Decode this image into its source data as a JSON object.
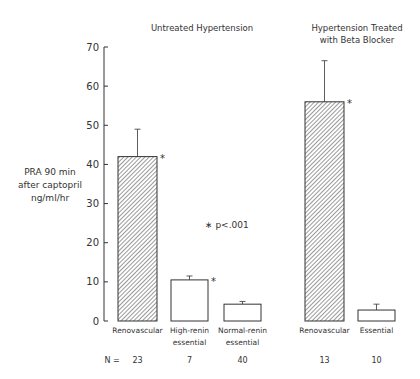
{
  "chart_data": {
    "type": "bar",
    "title": "",
    "group_titles": [
      {
        "lines": [
          "Untreated Hypertension"
        ]
      },
      {
        "lines": [
          "Hypertension Treated",
          "with Beta Blocker"
        ]
      }
    ],
    "ylabel": [
      "PRA 90 min",
      "after captopril",
      "ng/ml/hr"
    ],
    "xlabel": "",
    "ylim": [
      0,
      70
    ],
    "yticks": [
      0,
      10,
      20,
      30,
      40,
      50,
      60,
      70
    ],
    "grid": false,
    "legend": null,
    "annotation": "∗ p<.001",
    "n_label": "N =",
    "bars": [
      {
        "group": "Untreated Hypertension",
        "label": [
          "Renovascular"
        ],
        "value": 42,
        "error_top": 49,
        "hatched": true,
        "significant": true,
        "n": "23"
      },
      {
        "group": "Untreated Hypertension",
        "label": [
          "High-renin",
          "essential"
        ],
        "value": 10.5,
        "error_top": 11.5,
        "hatched": false,
        "significant": true,
        "n": "7"
      },
      {
        "group": "Untreated Hypertension",
        "label": [
          "Normal-renin",
          "essential"
        ],
        "value": 4.3,
        "error_top": 5,
        "hatched": false,
        "significant": false,
        "n": "40"
      },
      {
        "group": "Hypertension Treated with Beta Blocker",
        "label": [
          "Renovascular"
        ],
        "value": 56,
        "error_top": 66.5,
        "hatched": true,
        "significant": true,
        "n": "13"
      },
      {
        "group": "Hypertension Treated with Beta Blocker",
        "label": [
          "Essential"
        ],
        "value": 2.8,
        "error_top": 4.3,
        "hatched": false,
        "significant": false,
        "n": "10"
      }
    ],
    "categories": [
      "Renovascular",
      "High-renin essential",
      "Normal-renin essential",
      "Renovascular",
      "Essential"
    ],
    "values": [
      42,
      10.5,
      4.3,
      56,
      2.8
    ]
  },
  "colors": {
    "ink": "#333333",
    "hatch": "#555555",
    "background": "#ffffff"
  }
}
